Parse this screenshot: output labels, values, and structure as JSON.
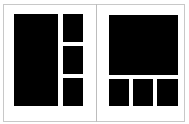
{
  "layouts": [
    {
      "name": "layout-1-large-left-3-stacked-right",
      "slots": [
        {
          "x": 14,
          "y": 14,
          "w": 44,
          "h": 92
        },
        {
          "x": 63,
          "y": 14,
          "w": 20,
          "h": 28
        },
        {
          "x": 63,
          "y": 46,
          "w": 20,
          "h": 28
        },
        {
          "x": 63,
          "y": 78,
          "w": 20,
          "h": 28
        }
      ]
    },
    {
      "name": "layout-2-large-top-3-row-bottom",
      "slots": [
        {
          "x": 109,
          "y": 15,
          "w": 69,
          "h": 60
        },
        {
          "x": 109,
          "y": 79,
          "w": 20,
          "h": 27
        },
        {
          "x": 133,
          "y": 79,
          "w": 20,
          "h": 27
        },
        {
          "x": 157,
          "y": 79,
          "w": 21,
          "h": 27
        }
      ]
    }
  ],
  "colors": {
    "slot": "#000000",
    "border": "#c8c8c8",
    "background": "#ffffff"
  }
}
